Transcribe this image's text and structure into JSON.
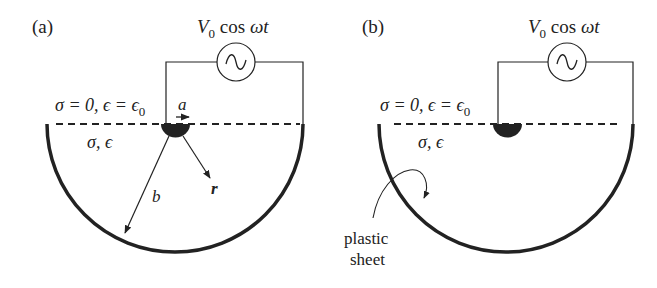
{
  "panels": [
    {
      "id": "a",
      "label": "(a)",
      "source_label": "V₀ cos ωt",
      "source_V": "V",
      "source_sub": "0",
      "source_rest": " cos ",
      "source_omega_t": "ωt",
      "upper_region": "σ = 0, ϵ = ϵ",
      "upper_region_sub": "0",
      "lower_region": "σ, ϵ",
      "electrode_radius_label": "a",
      "outer_radius_label": "b",
      "radial_label": "r"
    },
    {
      "id": "b",
      "label": "(b)",
      "source_V": "V",
      "source_sub": "0",
      "source_rest": " cos ",
      "source_omega_t": "ωt",
      "upper_region": "σ = 0, ϵ = ϵ",
      "upper_region_sub": "0",
      "lower_region": "σ, ϵ",
      "annotation_line1": "plastic",
      "annotation_line2": "sheet"
    }
  ],
  "colors": {
    "ink": "#222222",
    "background": "#ffffff"
  }
}
